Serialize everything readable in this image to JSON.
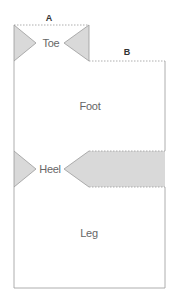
{
  "diagram": {
    "dimensions": [
      {
        "id": "A",
        "label": "A"
      },
      {
        "id": "B",
        "label": "B"
      }
    ],
    "regions": {
      "toe": "Toe",
      "foot": "Foot",
      "heel": "Heel",
      "leg": "Leg"
    },
    "caption": "",
    "colors": {
      "outline": "#9a9a9a",
      "fill": "#d9d9d9",
      "dashed": "#9a9a9a",
      "text": "#666666"
    }
  }
}
